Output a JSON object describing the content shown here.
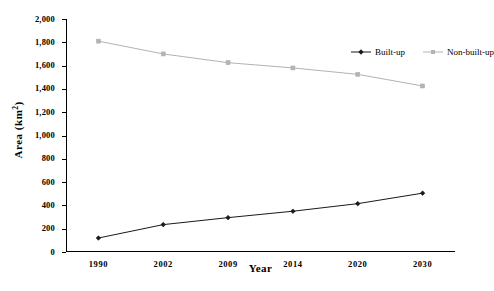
{
  "chart_data": {
    "type": "line",
    "title": "",
    "xlabel": "Year",
    "ylabel": "Area (km²)",
    "ylabel_base": "Area (km",
    "ylabel_sup": "2",
    "ylabel_close": ")",
    "categories": [
      "1990",
      "2002",
      "2009",
      "2014",
      "2020",
      "2030"
    ],
    "ylim": [
      0,
      2000
    ],
    "ytick_labels": [
      "0",
      "200",
      "400",
      "600",
      "800",
      "1,000",
      "1,200",
      "1,400",
      "1,600",
      "1,800",
      "2,000"
    ],
    "ytick_values": [
      0,
      200,
      400,
      600,
      800,
      1000,
      1200,
      1400,
      1600,
      1800,
      2000
    ],
    "grid": false,
    "legend_position": "top-right-inside",
    "series": [
      {
        "name": "Built-up",
        "color": "#1a1a1a",
        "marker": "diamond",
        "values": [
          120,
          235,
          295,
          350,
          415,
          505
        ]
      },
      {
        "name": "Non-built-up",
        "color": "#b3b3b3",
        "marker": "square",
        "values": [
          1810,
          1700,
          1625,
          1580,
          1525,
          1425
        ]
      }
    ]
  },
  "legend": {
    "items": [
      {
        "label": "Built-up",
        "color": "#1a1a1a"
      },
      {
        "label": "Non-built-up",
        "color": "#b3b3b3"
      }
    ]
  },
  "colors": {
    "built_up": "#1a1a1a",
    "non_built_up": "#b3b3b3",
    "axis": "#000000",
    "background": "#ffffff"
  }
}
